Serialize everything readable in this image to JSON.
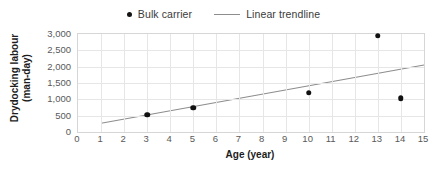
{
  "chart_data": {
    "type": "scatter",
    "title": "",
    "xlabel": "Age (year)",
    "ylabel": "Drydocking labour\n(man-day)",
    "xlim": [
      0,
      15
    ],
    "ylim": [
      0,
      3000
    ],
    "xticks": [
      "0",
      "1",
      "2",
      "3",
      "4",
      "5",
      "6",
      "7",
      "8",
      "9",
      "10",
      "11",
      "12",
      "13",
      "14",
      "15"
    ],
    "xtick_values": [
      0,
      1,
      2,
      3,
      4,
      5,
      6,
      7,
      8,
      9,
      10,
      11,
      12,
      13,
      14,
      15
    ],
    "yticks": [
      "0",
      "500",
      "1,000",
      "1,500",
      "2,000",
      "2,500",
      "3,000"
    ],
    "ytick_values": [
      0,
      500,
      1000,
      1500,
      2000,
      2500,
      3000
    ],
    "grid": true,
    "grid_color": "#e6e6e6",
    "plot_border_color": "#d6d6d6",
    "legend_position": "top-center",
    "series": [
      {
        "name": "Bulk carrier",
        "type": "scatter",
        "marker": "circle",
        "color": "#111111",
        "x": [
          3,
          5,
          10,
          13,
          14
        ],
        "values": [
          530,
          750,
          1200,
          2950,
          1030
        ],
        "points": [
          {
            "x": 3,
            "y": 530
          },
          {
            "x": 5,
            "y": 750
          },
          {
            "x": 10,
            "y": 1200
          },
          {
            "x": 13,
            "y": 2950
          },
          {
            "x": 14,
            "y": 1030
          }
        ]
      },
      {
        "name": "Linear trendline",
        "type": "line",
        "color": "#8d8d8d",
        "x": [
          1,
          15
        ],
        "values": [
          270,
          2050
        ],
        "points": [
          {
            "x": 1,
            "y": 270
          },
          {
            "x": 15,
            "y": 2050
          }
        ]
      }
    ]
  },
  "legend": {
    "entries": [
      {
        "label": "Bulk carrier",
        "marker": "dot-marker-icon"
      },
      {
        "label": "Linear trendline",
        "marker": "line-marker-icon"
      }
    ]
  }
}
